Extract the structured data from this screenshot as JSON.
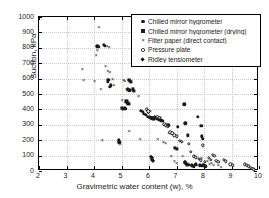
{
  "chart_data": {
    "type": "scatter",
    "title": "",
    "xlabel": "Gravimetric water content (w), %",
    "ylabel": "Suction, kPa",
    "xlim": [
      2,
      10
    ],
    "ylim": [
      0,
      1000
    ],
    "xticks": [
      2,
      3,
      4,
      5,
      6,
      7,
      8,
      9,
      10
    ],
    "yticks": [
      0,
      100,
      200,
      300,
      400,
      500,
      600,
      700,
      800,
      900,
      1000
    ],
    "xtick_labels": [
      "2",
      "3",
      "4",
      "5",
      "6",
      "7",
      "8",
      "9",
      "10"
    ],
    "ytick_labels": [
      "0",
      "100",
      "200",
      "300",
      "400",
      "500",
      "600",
      "700",
      "800",
      "900",
      "1000"
    ],
    "grid": true,
    "grid_style": "dotted",
    "legend_position": "upper right",
    "series": [
      {
        "name": "Chilled mirror hygrometer",
        "marker": "filled-circle",
        "color": "#1a1a1a",
        "points": [
          [
            4.12,
            810
          ],
          [
            4.18,
            805
          ],
          [
            4.35,
            818
          ],
          [
            4.4,
            812
          ],
          [
            4.52,
            592
          ],
          [
            4.5,
            578
          ],
          [
            4.58,
            548
          ],
          [
            4.62,
            556
          ],
          [
            4.9,
            200
          ],
          [
            4.92,
            186
          ],
          [
            5.22,
            530
          ],
          [
            5.28,
            524
          ],
          [
            5.12,
            408
          ],
          [
            5.16,
            402
          ],
          [
            5.7,
            392
          ],
          [
            5.78,
            386
          ],
          [
            5.82,
            372
          ],
          [
            5.88,
            366
          ],
          [
            5.95,
            352
          ],
          [
            6.02,
            348
          ],
          [
            6.08,
            344
          ],
          [
            6.12,
            340
          ],
          [
            6.18,
            338
          ],
          [
            6.22,
            352
          ],
          [
            6.3,
            338
          ],
          [
            6.35,
            334
          ],
          [
            6.42,
            330
          ],
          [
            6.48,
            326
          ],
          [
            6.62,
            300
          ],
          [
            6.7,
            296
          ],
          [
            7.05,
            288
          ],
          [
            7.28,
            432
          ],
          [
            7.32,
            310
          ],
          [
            7.4,
            232
          ],
          [
            7.78,
            350
          ],
          [
            7.9,
            292
          ],
          [
            7.92,
            226
          ],
          [
            7.95,
            210
          ],
          [
            7.3,
            52
          ],
          [
            7.38,
            46
          ],
          [
            7.45,
            40
          ],
          [
            7.55,
            36
          ],
          [
            7.62,
            30
          ],
          [
            7.7,
            44
          ],
          [
            7.85,
            38
          ],
          [
            7.92,
            32
          ],
          [
            7.98,
            42
          ],
          [
            8.05,
            30
          ]
        ]
      },
      {
        "name": "Chilled mirror hygrometer (drying)",
        "marker": "filled-square",
        "color": "#1a1a1a",
        "points": [
          [
            5.02,
            412
          ],
          [
            5.05,
            404
          ],
          [
            5.28,
            592
          ],
          [
            5.32,
            586
          ],
          [
            5.35,
            578
          ],
          [
            5.4,
            530
          ],
          [
            5.44,
            522
          ],
          [
            5.18,
            452
          ],
          [
            5.22,
            444
          ],
          [
            5.25,
            436
          ],
          [
            6.12,
            346
          ],
          [
            6.18,
            342
          ],
          [
            6.95,
            148
          ],
          [
            7.02,
            142
          ]
        ]
      },
      {
        "name": "Filter paper (direct contact)",
        "marker": "cross",
        "color": "#1a1a1a",
        "points": [
          [
            3.58,
            660
          ],
          [
            3.62,
            588
          ],
          [
            4.02,
            582
          ],
          [
            4.08,
            752
          ],
          [
            4.12,
            786
          ],
          [
            4.18,
            932
          ],
          [
            4.25,
            530
          ],
          [
            4.48,
            812
          ],
          [
            4.55,
            806
          ],
          [
            4.42,
            684
          ],
          [
            4.5,
            652
          ],
          [
            4.58,
            640
          ],
          [
            4.68,
            596
          ],
          [
            4.72,
            560
          ],
          [
            4.3,
            202
          ],
          [
            4.9,
            182
          ],
          [
            4.95,
            176
          ],
          [
            5.02,
            462
          ],
          [
            5.08,
            592
          ],
          [
            5.12,
            586
          ],
          [
            5.18,
            530
          ],
          [
            5.22,
            524
          ],
          [
            5.28,
            262
          ],
          [
            5.62,
            490
          ],
          [
            5.68,
            206
          ],
          [
            5.92,
            398
          ],
          [
            5.98,
            376
          ],
          [
            6.05,
            390
          ],
          [
            6.12,
            344
          ],
          [
            6.18,
            336
          ],
          [
            6.32,
            206
          ],
          [
            6.4,
            348
          ],
          [
            6.52,
            188
          ],
          [
            6.6,
            182
          ],
          [
            6.72,
            248
          ],
          [
            6.8,
            96
          ],
          [
            6.92,
            62
          ],
          [
            7.0,
            52
          ],
          [
            7.22,
            98
          ],
          [
            7.3,
            58
          ],
          [
            7.48,
            42
          ],
          [
            7.55,
            34
          ],
          [
            7.68,
            46
          ],
          [
            7.75,
            38
          ],
          [
            7.9,
            86
          ],
          [
            7.98,
            30
          ],
          [
            8.12,
            62
          ],
          [
            8.2,
            48
          ],
          [
            8.28,
            54
          ],
          [
            8.35,
            40
          ],
          [
            8.52,
            36
          ],
          [
            8.62,
            28
          ]
        ]
      },
      {
        "name": "Pressure plate",
        "marker": "open-circle",
        "color": "#1a1a1a",
        "points": [
          [
            5.92,
            400
          ],
          [
            5.98,
            388
          ],
          [
            6.3,
            352
          ],
          [
            6.38,
            344
          ],
          [
            6.55,
            302
          ],
          [
            6.62,
            296
          ],
          [
            6.68,
            288
          ],
          [
            6.78,
            252
          ],
          [
            6.85,
            244
          ],
          [
            6.92,
            232
          ],
          [
            7.0,
            226
          ],
          [
            7.12,
            196
          ],
          [
            7.2,
            188
          ],
          [
            7.45,
            176
          ],
          [
            7.52,
            126
          ],
          [
            7.62,
            96
          ],
          [
            7.7,
            88
          ],
          [
            7.82,
            78
          ],
          [
            7.88,
            70
          ],
          [
            7.95,
            166
          ],
          [
            8.02,
            60
          ],
          [
            8.18,
            84
          ],
          [
            8.25,
            72
          ],
          [
            8.32,
            106
          ],
          [
            8.38,
            98
          ],
          [
            8.45,
            66
          ],
          [
            8.52,
            58
          ],
          [
            8.72,
            72
          ],
          [
            8.8,
            64
          ],
          [
            8.95,
            44
          ],
          [
            9.05,
            38
          ],
          [
            9.48,
            44
          ],
          [
            9.55,
            38
          ],
          [
            9.62,
            30
          ],
          [
            9.7,
            22
          ],
          [
            9.75,
            16
          ],
          [
            9.8,
            10
          ]
        ]
      },
      {
        "name": "Ridley tensiometer",
        "marker": "filled-diamond",
        "color": "#1a1a1a",
        "points": [
          [
            6.08,
            92
          ],
          [
            6.1,
            82
          ],
          [
            6.12,
            72
          ],
          [
            6.14,
            62
          ],
          [
            7.32,
            56
          ],
          [
            7.35,
            48
          ],
          [
            7.38,
            40
          ]
        ]
      }
    ]
  },
  "legend": {
    "entries": [
      {
        "label": "Chilled mirror hygrometer",
        "marker": "filled-circle"
      },
      {
        "label": "Chilled mirror hygrometer (drying)",
        "marker": "filled-square"
      },
      {
        "label": "Filter paper (direct contact)",
        "marker": "cross"
      },
      {
        "label": "Pressure plate",
        "marker": "open-circle"
      },
      {
        "label": "Ridley tensiometer",
        "marker": "filled-diamond"
      }
    ]
  }
}
